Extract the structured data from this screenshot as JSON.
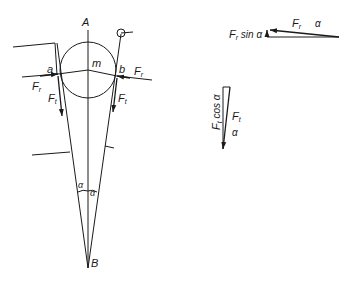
{
  "diagram": {
    "type": "force-diagram",
    "points": {
      "A": "A",
      "B": "B",
      "m": "m",
      "a": "a",
      "b": "b"
    },
    "forces": {
      "Fr": "F",
      "Fr_sub": "r",
      "Ft": "F",
      "Ft_sub": "t"
    },
    "angles": {
      "alpha": "α"
    },
    "triangle_horizontal": {
      "label_sin": "sin α",
      "label_F": "F",
      "label_F_sub": "r",
      "label_alpha": "α"
    },
    "triangle_vertical": {
      "label_cos": "cos α",
      "label_F": "F",
      "label_F_sub": "t",
      "label_alpha": "α"
    },
    "stroke_color": "#1a1a1a",
    "background": "#ffffff"
  }
}
